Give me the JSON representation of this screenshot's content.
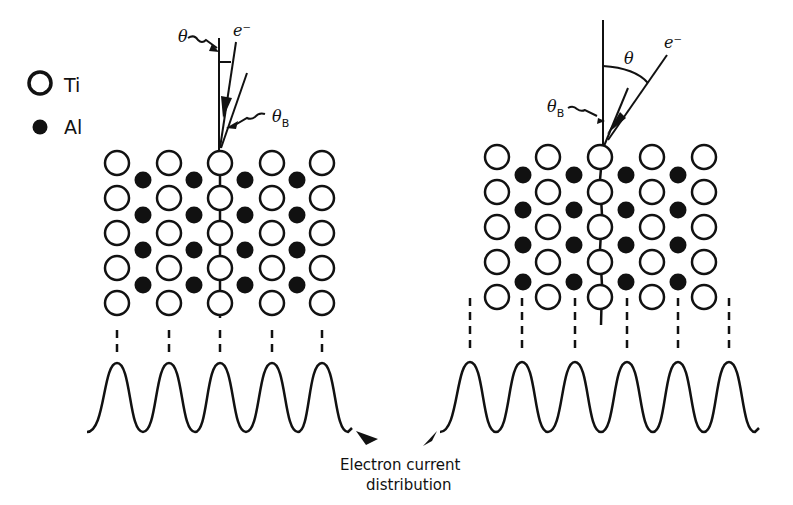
{
  "legend": {
    "items": [
      {
        "symbol": "open-circle",
        "label": "Ti"
      },
      {
        "symbol": "filled-circle",
        "label": "Al"
      }
    ]
  },
  "left_panel": {
    "theta_label": "θ",
    "electron_label": "e⁻",
    "theta_b_label": "θ",
    "theta_b_sub": "B",
    "ti_columns_x": [
      117,
      169,
      220,
      272,
      322
    ],
    "ti_rows_y": [
      163,
      198,
      233,
      268,
      303
    ],
    "al_columns_x": [
      143,
      194,
      245,
      297
    ],
    "al_rows_y": [
      180,
      215,
      250,
      285
    ],
    "peaks_x": [
      117,
      169,
      220,
      272,
      322
    ]
  },
  "right_panel": {
    "theta_label": "θ",
    "electron_label": "e⁻",
    "theta_b_label": "θ",
    "theta_b_sub": "B",
    "ti_columns_x": [
      497,
      548,
      600,
      652,
      704
    ],
    "ti_rows_y": [
      157,
      192,
      227,
      262,
      297
    ],
    "al_columns_x": [
      523,
      574,
      626,
      678
    ],
    "al_rows_y": [
      175,
      210,
      245,
      282
    ],
    "peaks_x": [
      470,
      522,
      575,
      627,
      678,
      729
    ]
  },
  "caption": {
    "line1": "Electron current",
    "line2": "distribution"
  },
  "colors": {
    "ink": "#111111",
    "background": "#ffffff"
  }
}
